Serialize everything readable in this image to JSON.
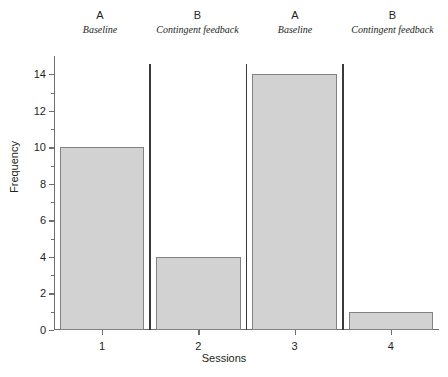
{
  "chart_data": {
    "type": "bar",
    "title": "",
    "xlabel": "Sessions",
    "ylabel": "Frequency",
    "categories": [
      "1",
      "2",
      "3",
      "4"
    ],
    "values": [
      10,
      4,
      14,
      1
    ],
    "ylim": [
      0,
      15
    ],
    "ytick_labels": [
      "0",
      "2",
      "4",
      "6",
      "8",
      "10",
      "12",
      "14"
    ],
    "ytick_values": [
      0,
      2,
      4,
      6,
      8,
      10,
      12,
      14
    ],
    "yminor_values": [
      1,
      3,
      5,
      7,
      9,
      11,
      13
    ],
    "grid": false,
    "legend": "none",
    "bar_fill": "#d2d2d2",
    "bar_stroke": "#808285",
    "axis_color": "#6d6e71",
    "divider_color": "#3a3a3c",
    "phases": [
      {
        "letter": "A",
        "name": "Baseline"
      },
      {
        "letter": "B",
        "name": "Contingent feedback"
      },
      {
        "letter": "A",
        "name": "Baseline"
      },
      {
        "letter": "B",
        "name": "Contingent feedback"
      }
    ],
    "phase_dividers": [
      1.5,
      2.5,
      3.5
    ]
  }
}
